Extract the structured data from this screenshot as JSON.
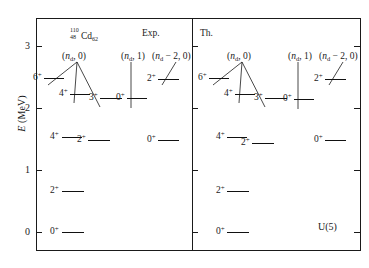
{
  "figure": {
    "axis": {
      "label_symbol": "E",
      "label_unit": " (MeV)",
      "ticks": [
        "0",
        "1",
        "2",
        "3"
      ],
      "tick_values": [
        0,
        1,
        2,
        3
      ],
      "ylim": [
        -0.25,
        3.45
      ]
    },
    "panels": [
      {
        "id": "exp",
        "header": "Exp."
      },
      {
        "id": "th",
        "header": "Th."
      }
    ],
    "isotope": {
      "mass": "110",
      "z": "48",
      "symbol": "Cd",
      "n": "62"
    },
    "corner_label": "U(5)",
    "band_labels": {
      "nd0": {
        "open": "(",
        "nd": "n",
        "sub": "d",
        "rest": ", 0)"
      },
      "nd1": {
        "open": "(",
        "nd": "n",
        "sub": "d",
        "rest": ", 1)"
      },
      "ndm2": {
        "open": "(",
        "nd": "n",
        "sub": "d",
        "rest": " − 2, 0)"
      }
    },
    "spin_labels": {
      "zero": "0",
      "two": "2",
      "three": "3",
      "four": "4",
      "six": "6",
      "parity": "+"
    }
  },
  "chart_data": {
    "type": "scatter",
    "xlabel": "",
    "ylabel": "E (MeV)",
    "ylim": [
      -0.25,
      3.45
    ],
    "yticks": [
      0,
      1,
      2,
      3
    ],
    "grid": false,
    "legend": "none",
    "annotations": [
      "110-48-Cd-62",
      "Exp.",
      "Th.",
      "U(5)",
      "(n_d, 0)",
      "(n_d, 1)",
      "(n_d - 2, 0)"
    ],
    "series": [
      {
        "name": "Exp. (n_d, 0) band",
        "panel": "exp",
        "band": "(n_d, 0)",
        "levels": [
          {
            "spin": "0+",
            "energy": 0.0
          },
          {
            "spin": "2+",
            "energy": 0.66
          },
          {
            "spin": "4+",
            "energy": 1.54
          },
          {
            "spin": "2+",
            "energy": 1.48
          },
          {
            "spin": "6+",
            "energy": 2.48
          },
          {
            "spin": "4+",
            "energy": 2.22
          },
          {
            "spin": "3+",
            "energy": 2.16
          }
        ]
      },
      {
        "name": "Exp. (n_d, 1) band",
        "panel": "exp",
        "band": "(n_d, 1)",
        "levels": [
          {
            "spin": "0+",
            "energy": 2.16
          }
        ]
      },
      {
        "name": "Exp. (n_d - 2, 0) band",
        "panel": "exp",
        "band": "(n_d - 2, 0)",
        "levels": [
          {
            "spin": "2+",
            "energy": 2.46
          },
          {
            "spin": "0+",
            "energy": 1.48
          }
        ]
      },
      {
        "name": "Th. (n_d, 0) band",
        "panel": "th",
        "band": "(n_d, 0)",
        "levels": [
          {
            "spin": "0+",
            "energy": 0.0
          },
          {
            "spin": "2+",
            "energy": 0.66
          },
          {
            "spin": "4+",
            "energy": 1.54
          },
          {
            "spin": "2+",
            "energy": 1.44
          },
          {
            "spin": "6+",
            "energy": 2.48
          },
          {
            "spin": "4+",
            "energy": 2.22
          },
          {
            "spin": "3+",
            "energy": 2.16
          }
        ]
      },
      {
        "name": "Th. (n_d, 1) band",
        "panel": "th",
        "band": "(n_d, 1)",
        "levels": [
          {
            "spin": "0+",
            "energy": 2.14
          }
        ]
      },
      {
        "name": "Th. (n_d - 2, 0) band",
        "panel": "th",
        "band": "(n_d - 2, 0)",
        "levels": [
          {
            "spin": "2+",
            "energy": 2.46
          },
          {
            "spin": "0+",
            "energy": 1.48
          }
        ]
      }
    ]
  }
}
